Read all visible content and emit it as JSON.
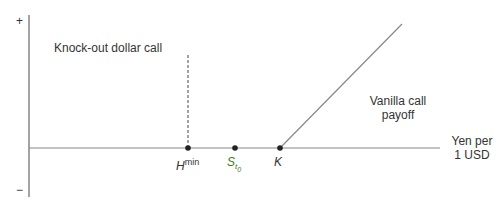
{
  "axes": {
    "y_plus": "+",
    "y_minus": "−",
    "x_label_line1": "Yen per",
    "x_label_line2": "1 USD"
  },
  "labels": {
    "knockout": "Knock-out dollar call",
    "vanilla_line1": "Vanilla call",
    "vanilla_line2": "payoff"
  },
  "points": {
    "h_base": "H",
    "h_sup": "min",
    "s_base": "S",
    "s_sub": "t",
    "s_subsub": "0",
    "k": "K"
  },
  "colors": {
    "axis": "#666666",
    "line": "#888888",
    "point": "#222222",
    "spot_label": "#3a7a1e"
  }
}
